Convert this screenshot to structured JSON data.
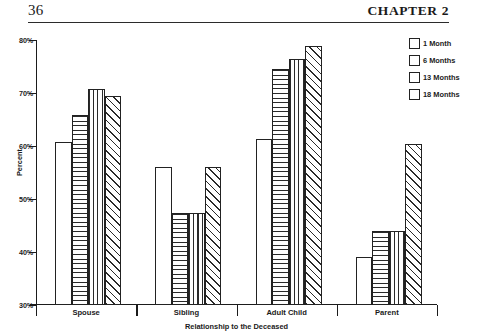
{
  "page": {
    "folio": "36",
    "running_head": "CHAPTER 2"
  },
  "legend": {
    "position": "right",
    "items": [
      {
        "label": "1 Month",
        "pattern": "none"
      },
      {
        "label": "6 Months",
        "pattern": "horiz"
      },
      {
        "label": "13 Months",
        "pattern": "vert"
      },
      {
        "label": "18 Months",
        "pattern": "diag"
      }
    ]
  },
  "chart_data": {
    "type": "bar",
    "title": "",
    "xlabel": "Relationship to the Deceased",
    "ylabel": "Percent",
    "ylim": [
      30,
      80
    ],
    "yticks": [
      "30%",
      "40%",
      "50%",
      "60%",
      "70%",
      "80%"
    ],
    "ytick_values": [
      30,
      40,
      50,
      60,
      70,
      80
    ],
    "grid": false,
    "categories": [
      "Spouse",
      "Sibling",
      "Adult Child",
      "Parent"
    ],
    "series": [
      {
        "name": "1 Month",
        "pattern": "none",
        "values": [
          60.7,
          56.0,
          61.3,
          39.0
        ]
      },
      {
        "name": "6 Months",
        "pattern": "horiz",
        "values": [
          65.8,
          47.4,
          74.6,
          44.0
        ]
      },
      {
        "name": "13 Months",
        "pattern": "vert",
        "values": [
          70.8,
          47.4,
          76.5,
          44.0
        ]
      },
      {
        "name": "18 Months",
        "pattern": "diag",
        "values": [
          69.4,
          56.0,
          78.8,
          60.4
        ]
      }
    ]
  }
}
